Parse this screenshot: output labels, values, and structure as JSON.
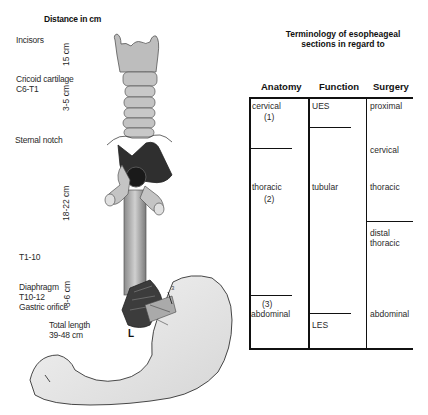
{
  "left_labels": {
    "title": "Distance in cm",
    "incisors": "Incisors",
    "cricoid_line1": "Cricoid cartilage",
    "cricoid_line2": "C6-T1",
    "sternal_notch": "Sternal notch",
    "t1_10": "T1-10",
    "diaphragm_line1": "Diaphragm",
    "diaphragm_line2": "T10-12",
    "diaphragm_line3": "Gastric orifice",
    "total_line1": "Total length",
    "total_line2": "39-48 cm"
  },
  "distances": {
    "d1": "15 cm",
    "d2": "3-5 cm",
    "d3": "18-22 cm",
    "d4": "3-6 cm"
  },
  "illustration": {
    "marker": "L",
    "stomach_marker": "3"
  },
  "table": {
    "title_line1": "Terminology of esopheageal",
    "title_line2": "sections in regard to",
    "headers": [
      "Anatomy",
      "Function",
      "Surgery"
    ],
    "anatomy": [
      {
        "label": "cervical",
        "number": "(1)"
      },
      {
        "label": "thoracic",
        "number": "(2)"
      },
      {
        "label": "abdominal",
        "number": "(3)"
      }
    ],
    "function": [
      "UES",
      "tubular",
      "LES"
    ],
    "surgery": [
      "proximal",
      "cervical",
      "thoracic",
      "distal",
      "thoracic",
      "abdominal"
    ]
  },
  "colors": {
    "line": "#111111",
    "cartilage": "#c8c8c8",
    "aorta": "#3a3a3a",
    "stomach": "#ececec"
  }
}
